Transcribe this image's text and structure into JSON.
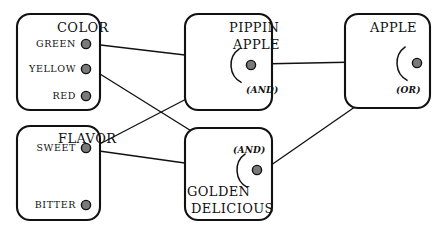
{
  "diagram": {
    "type": "inference-network",
    "title": "",
    "background_color": "#ffffff",
    "line_color": "#111111",
    "node_fill_color": "#7a7a7a",
    "node_stroke_color": "#111111",
    "boxes": [
      {
        "id": "color",
        "title": "COLOR",
        "title_x": 57,
        "title_y": 32,
        "x": 17,
        "y": 14,
        "width": 83,
        "height": 96,
        "nodes": [
          {
            "id": "green",
            "label": "GREEN",
            "cx": 86,
            "cy": 44,
            "label_x": 76,
            "label_y": 47
          },
          {
            "id": "yellow",
            "label": "YELLOW",
            "cx": 86,
            "cy": 69,
            "label_x": 76,
            "label_y": 72
          },
          {
            "id": "red",
            "label": "RED",
            "cx": 86,
            "cy": 96,
            "label_x": 76,
            "label_y": 99
          }
        ]
      },
      {
        "id": "flavor",
        "title": "FLAVOR",
        "title_x": 58,
        "title_y": 143,
        "x": 17,
        "y": 126,
        "width": 83,
        "height": 94,
        "nodes": [
          {
            "id": "sweet",
            "label": "SWEET",
            "cx": 86,
            "cy": 148,
            "label_x": 76,
            "label_y": 151
          },
          {
            "id": "bitter",
            "label": "BITTER",
            "cx": 86,
            "cy": 205,
            "label_x": 76,
            "label_y": 208
          }
        ]
      },
      {
        "id": "pippin-apple",
        "title": "PIPPIN APPLE",
        "title_line1": "PIPPIN",
        "title_line2": "APPLE",
        "title_x": 229,
        "title_y": 32,
        "title2_y": 49,
        "x": 185,
        "y": 14,
        "width": 87,
        "height": 96,
        "nodes": [
          {
            "id": "pippin",
            "label": "",
            "cx": 251,
            "cy": 65,
            "label_x": 0,
            "label_y": 0
          }
        ],
        "gate": {
          "label": "(AND)",
          "x": 246,
          "y": 93
        }
      },
      {
        "id": "golden-delicious",
        "title": "GOLDEN DELICIOUS",
        "title_line1": "GOLDEN",
        "title_line2": "DELICIOUS",
        "title_x": 187,
        "title_y": 196,
        "title2_y": 213,
        "x": 185,
        "y": 128,
        "width": 87,
        "height": 92,
        "nodes": [
          {
            "id": "golden",
            "label": "",
            "cx": 257,
            "cy": 170,
            "label_x": 0,
            "label_y": 0
          }
        ],
        "gate": {
          "label": "(AND)",
          "x": 233,
          "y": 153
        }
      },
      {
        "id": "apple",
        "title": "APPLE",
        "title_line1": "APPLE",
        "title_line2": "",
        "title_x": 370,
        "title_y": 32,
        "title2_y": 0,
        "x": 345,
        "y": 14,
        "width": 85,
        "height": 94,
        "nodes": [
          {
            "id": "apple",
            "label": "",
            "cx": 417,
            "cy": 63,
            "label_x": 0,
            "label_y": 0
          }
        ],
        "gate": {
          "label": "(OR)",
          "x": 396,
          "y": 93
        }
      }
    ],
    "edges": [
      {
        "id": "green-to-pippin",
        "from": "green",
        "to": "pippin",
        "x1": 92,
        "y1": 44,
        "x2": 244,
        "y2": 62
      },
      {
        "id": "sweet-to-pippin",
        "from": "sweet",
        "to": "pippin",
        "x1": 92,
        "y1": 148,
        "x2": 244,
        "y2": 69
      },
      {
        "id": "yellow-to-golden",
        "from": "yellow",
        "to": "golden",
        "x1": 92,
        "y1": 69,
        "x2": 249,
        "y2": 167
      },
      {
        "id": "sweet-to-golden",
        "from": "sweet",
        "to": "golden",
        "x1": 92,
        "y1": 150,
        "x2": 249,
        "y2": 172
      },
      {
        "id": "pippin-to-apple",
        "from": "pippin",
        "to": "apple",
        "x1": 258,
        "y1": 64,
        "x2": 410,
        "y2": 61
      },
      {
        "id": "golden-to-apple",
        "from": "golden",
        "to": "apple",
        "x1": 264,
        "y1": 170,
        "x2": 411,
        "y2": 68
      }
    ]
  }
}
